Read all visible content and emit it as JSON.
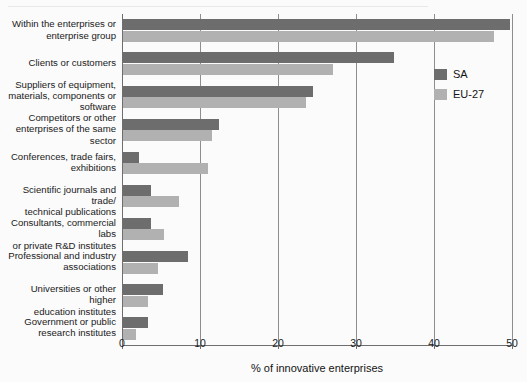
{
  "chart_data": {
    "type": "bar",
    "orientation": "horizontal",
    "title": "",
    "subtitle": "",
    "xlabel": "% of innovative enterprises",
    "ylabel": "",
    "xlim": [
      0,
      50
    ],
    "xticks": [
      0,
      10,
      20,
      30,
      40,
      50
    ],
    "xtick_labels": [
      "0",
      "10",
      "20",
      "30",
      "40",
      "50"
    ],
    "grid": true,
    "grid_axis": "x",
    "legend_position": "right-inside-top",
    "categories": [
      "Within the enterprises or enterprise group",
      "Clients or customers",
      "Suppliers of equipment, materials, components or software",
      "Competitors or other enterprises of the same sector",
      "Conferences, trade fairs, exhibitions",
      "Scientific journals and trade/ technical publications",
      "Consultants, commercial labs or private R&D institutes",
      "Professional and industry associations",
      "Universities or other higher education institutes",
      "Government or public research institutes"
    ],
    "category_lines": [
      [
        "Within the enterprises or",
        "enterprise group"
      ],
      [
        "Clients or customers"
      ],
      [
        "Suppliers of equipment,",
        "materials, components or",
        "software"
      ],
      [
        "Competitors or other",
        "enterprises of the same",
        "sector"
      ],
      [
        "Conferences, trade fairs,",
        "exhibitions"
      ],
      [
        "Scientific journals and trade/",
        "technical publications"
      ],
      [
        "Consultants, commercial labs",
        "or private R&D institutes"
      ],
      [
        "Professional and industry",
        "associations"
      ],
      [
        "Universities or other higher",
        "education institutes"
      ],
      [
        "Government or public",
        "research institutes"
      ]
    ],
    "series": [
      {
        "name": "SA",
        "color": "#6d6d6d",
        "values": [
          49.6,
          34.7,
          24.4,
          12.3,
          2.1,
          3.6,
          3.6,
          8.3,
          5.1,
          3.2
        ]
      },
      {
        "name": "EU-27",
        "color": "#b1b1b1",
        "values": [
          47.6,
          26.9,
          23.5,
          11.4,
          10.9,
          7.2,
          5.2,
          4.5,
          3.2,
          1.7
        ]
      }
    ]
  },
  "legend": {
    "items": [
      {
        "label": "SA",
        "color": "#6d6d6d"
      },
      {
        "label": "EU-27",
        "color": "#b1b1b1"
      }
    ]
  },
  "colors": {
    "sa": "#6d6d6d",
    "eu27": "#b1b1b1",
    "grid": "#8e8e8e",
    "axis": "#6e6e6e",
    "background": "#fbfbfb"
  }
}
